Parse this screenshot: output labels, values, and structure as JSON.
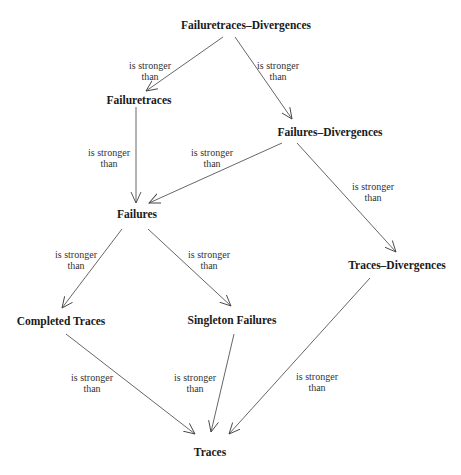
{
  "diagram": {
    "type": "directed-graph",
    "nodes": [
      {
        "id": "ftd",
        "label": "Failuretraces–Divergences"
      },
      {
        "id": "ft",
        "label": "Failuretraces"
      },
      {
        "id": "fd",
        "label": "Failures–Divergences"
      },
      {
        "id": "f",
        "label": "Failures"
      },
      {
        "id": "td",
        "label": "Traces–Divergences"
      },
      {
        "id": "ct",
        "label": "Completed Traces"
      },
      {
        "id": "sf",
        "label": "Singleton Failures"
      },
      {
        "id": "t",
        "label": "Traces"
      }
    ],
    "edge_label_line1": "is stronger",
    "edge_label_line2": "than",
    "edges": [
      {
        "from": "ftd",
        "to": "ft"
      },
      {
        "from": "ftd",
        "to": "fd"
      },
      {
        "from": "ft",
        "to": "f"
      },
      {
        "from": "fd",
        "to": "f"
      },
      {
        "from": "fd",
        "to": "td"
      },
      {
        "from": "f",
        "to": "ct"
      },
      {
        "from": "f",
        "to": "sf"
      },
      {
        "from": "ct",
        "to": "t"
      },
      {
        "from": "sf",
        "to": "t"
      },
      {
        "from": "td",
        "to": "t"
      }
    ]
  }
}
